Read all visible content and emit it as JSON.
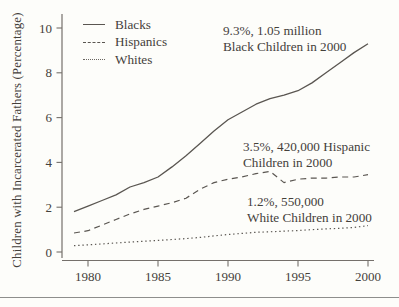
{
  "chart_data": {
    "type": "line",
    "title": "",
    "xlabel": "",
    "ylabel": "Children with Incarcerated Fathers (Percentage)",
    "x": [
      1979,
      1980,
      1981,
      1982,
      1983,
      1984,
      1985,
      1986,
      1987,
      1988,
      1989,
      1990,
      1991,
      1992,
      1993,
      1994,
      1995,
      1996,
      1997,
      1998,
      1999,
      2000
    ],
    "series": [
      {
        "name": "Blacks",
        "style": "solid",
        "values": [
          1.8,
          2.05,
          2.3,
          2.55,
          2.9,
          3.1,
          3.35,
          3.8,
          4.3,
          4.85,
          5.4,
          5.9,
          6.25,
          6.6,
          6.85,
          7.0,
          7.2,
          7.55,
          8.0,
          8.45,
          8.9,
          9.3
        ]
      },
      {
        "name": "Hispanics",
        "style": "dashed",
        "values": [
          0.85,
          0.95,
          1.2,
          1.45,
          1.7,
          1.9,
          2.05,
          2.2,
          2.4,
          2.8,
          3.1,
          3.25,
          3.35,
          3.5,
          3.6,
          3.1,
          3.25,
          3.3,
          3.3,
          3.35,
          3.35,
          3.45
        ]
      },
      {
        "name": "Whites",
        "style": "dotted",
        "values": [
          0.28,
          0.32,
          0.36,
          0.4,
          0.44,
          0.48,
          0.52,
          0.56,
          0.6,
          0.65,
          0.72,
          0.78,
          0.83,
          0.88,
          0.9,
          0.93,
          0.96,
          1.0,
          1.03,
          1.06,
          1.1,
          1.18
        ]
      }
    ],
    "xticks": [
      1980,
      1985,
      1990,
      1995,
      2000
    ],
    "yticks": [
      0,
      2,
      4,
      6,
      8,
      10
    ],
    "xlim": [
      1978.2,
      2000.5
    ],
    "ylim": [
      0,
      10.6
    ],
    "grid": false,
    "legend_position": "top-left",
    "annotations": [
      {
        "line1": "9.3%, 1.05 million",
        "line2": "Black Children in 2000"
      },
      {
        "line1": "3.5%, 420,000 Hispanic",
        "line2": "Children in 2000"
      },
      {
        "line1": "1.2%, 550,000",
        "line2": "White Children in 2000"
      }
    ],
    "colors": {
      "line": "#5a5651",
      "axis": "#75706b",
      "text": "#45413b",
      "rule": "#8e8e8c"
    }
  }
}
